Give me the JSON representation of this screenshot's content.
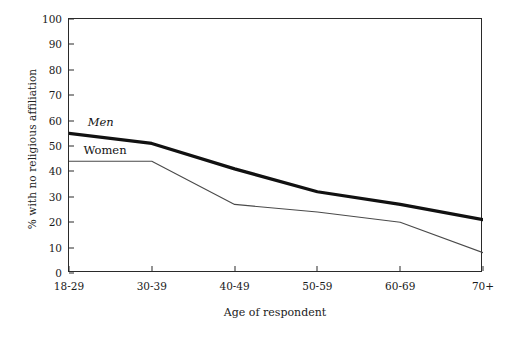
{
  "chart_data": {
    "type": "line",
    "title": "",
    "xlabel": "Age of respondent",
    "ylabel": "% with no religious affiliation",
    "categories": [
      "18-29",
      "30-39",
      "40-49",
      "50-59",
      "60-69",
      "70+"
    ],
    "series": [
      {
        "name": "Men",
        "values": [
          55,
          51,
          41,
          32,
          27,
          21
        ],
        "color": "#111111",
        "line_width": 3.2,
        "style": "thick"
      },
      {
        "name": "Women",
        "values": [
          44,
          44,
          27,
          24,
          20,
          8
        ],
        "color": "#4a4a4a",
        "line_width": 1.1,
        "style": "thin"
      }
    ],
    "ylim": [
      0,
      100
    ],
    "yticks": [
      0,
      10,
      20,
      30,
      40,
      50,
      60,
      70,
      80,
      90,
      100
    ],
    "ytick_labels": [
      "0",
      "10",
      "20",
      "30",
      "40",
      "50",
      "60",
      "70",
      "80",
      "90",
      "100"
    ],
    "grid": false,
    "legend": "inline-annotations",
    "legend_position": "left-inside-plot",
    "annotations": [
      {
        "text": "Men",
        "series": "Men",
        "x_frac": 0.045,
        "y_value": 59
      },
      {
        "text": "Women",
        "series": "Women",
        "x_frac": 0.035,
        "y_value": 48
      }
    ],
    "frame": "full-box",
    "background": "#ffffff"
  }
}
